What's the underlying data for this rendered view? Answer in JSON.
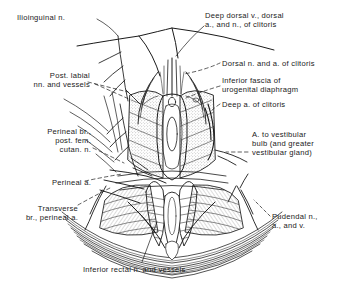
{
  "figure": {
    "style": "pen-and-ink stippled line drawing",
    "background_color": "#ffffff",
    "ink_color": "#1a1a1a",
    "label_count": 11
  },
  "labels": {
    "ilioinguinal": {
      "text": "Ilioinguinal n.",
      "align": "right",
      "x": 17,
      "y": 13
    },
    "deep_dorsal": {
      "text": "Deep dorsal v., dorsal\na., and n., of clitoris",
      "align": "left",
      "x": 205,
      "y": 11
    },
    "post_labial": {
      "text": "Post. labial\nnn. and vessels",
      "align": "right",
      "x": 18,
      "y": 71
    },
    "dorsal_n_a": {
      "text": "Dorsal n. and a. of clitoris",
      "align": "left",
      "x": 222,
      "y": 59
    },
    "inferior_fascia": {
      "text": "Inferior fascia of\nurogenital diaphragm",
      "align": "left",
      "x": 222,
      "y": 76
    },
    "deep_a_clitoris": {
      "text": "Deep a. of clitoris",
      "align": "left",
      "x": 222,
      "y": 100
    },
    "perineal_br": {
      "text": "Perineal br.,\npost. fem.\ncutan. n.",
      "align": "right",
      "x": 23,
      "y": 127
    },
    "a_vestibular": {
      "text": "A. to vestibular\nbulb (and greater\nvestibular gland)",
      "align": "left",
      "x": 252,
      "y": 130
    },
    "perineal_a": {
      "text": "Perineal a.",
      "align": "right",
      "x": 23,
      "y": 178
    },
    "transverse_br": {
      "text": "Transverse\nbr., perineal a.",
      "align": "right",
      "x": 12,
      "y": 204
    },
    "pudendal": {
      "text": "Pudendal n.,\na., and v.",
      "align": "left",
      "x": 272,
      "y": 212
    },
    "inferior_rectal": {
      "text": "Inferior rectal n. and vessels",
      "align": "center",
      "x": 83,
      "y": 265
    }
  }
}
